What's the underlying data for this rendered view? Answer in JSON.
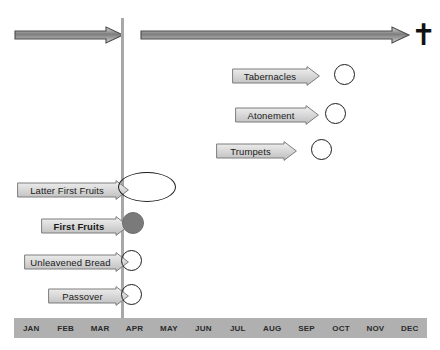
{
  "diagram": {
    "colors": {
      "background": "#ffffff",
      "divider_line": "#a8a8a8",
      "month_bar": "#b0b0b0",
      "month_label": "#2b2b2b",
      "arrow_fill_light": "#efefef",
      "arrow_fill_dark": "#b9b9b9",
      "arrow_stroke": "#6f6f6f",
      "marker_stroke": "#1d1d1d",
      "marker_filled": "#7a7a7a",
      "cross": "#111111"
    }
  },
  "era_arrows": [
    {
      "name": "left-era-arrow",
      "label": ""
    },
    {
      "name": "right-era-arrow",
      "label": ""
    }
  ],
  "cross": {
    "glyph": "✝",
    "name": "cross-icon"
  },
  "fall_feasts": [
    {
      "label": "Tabernacles",
      "bold": false,
      "label_left": 232,
      "label_top": 66,
      "label_width": 88,
      "marker_left": 334,
      "marker_top": 64,
      "marker_size": 21
    },
    {
      "label": "Atonement",
      "bold": false,
      "label_left": 235,
      "label_top": 105,
      "label_width": 84,
      "marker_left": 325,
      "marker_top": 103,
      "marker_size": 21
    },
    {
      "label": "Trumpets",
      "bold": false,
      "label_left": 216,
      "label_top": 141,
      "label_width": 81,
      "marker_left": 311,
      "marker_top": 139,
      "marker_size": 21
    }
  ],
  "spring_feasts": [
    {
      "label": "Latter First Fruits",
      "bold": false,
      "label_left": 17,
      "label_top": 180,
      "label_width": 112,
      "marker_left": 118,
      "marker_top": 172,
      "marker_width": 58,
      "marker_height": 30
    },
    {
      "label": "First Fruits",
      "bold": true,
      "label_left": 41,
      "label_top": 216,
      "label_width": 88,
      "marker_left": 122,
      "marker_top": 212,
      "marker_width": 22,
      "marker_height": 22,
      "filled": true
    },
    {
      "label": "Unleavened Bread",
      "bold": false,
      "label_left": 24,
      "label_top": 252,
      "label_width": 105,
      "marker_left": 121,
      "marker_top": 250,
      "marker_width": 21,
      "marker_height": 21
    },
    {
      "label": "Passover",
      "bold": false,
      "label_left": 48,
      "label_top": 286,
      "label_width": 81,
      "marker_left": 121,
      "marker_top": 284,
      "marker_width": 21,
      "marker_height": 21
    }
  ],
  "months": [
    {
      "label": "JAN"
    },
    {
      "label": "FEB"
    },
    {
      "label": "MAR"
    },
    {
      "label": "APR"
    },
    {
      "label": "MAY"
    },
    {
      "label": "JUN"
    },
    {
      "label": "JUL"
    },
    {
      "label": "AUG"
    },
    {
      "label": "SEP"
    },
    {
      "label": "OCT"
    },
    {
      "label": "NOV"
    },
    {
      "label": "DEC"
    }
  ]
}
